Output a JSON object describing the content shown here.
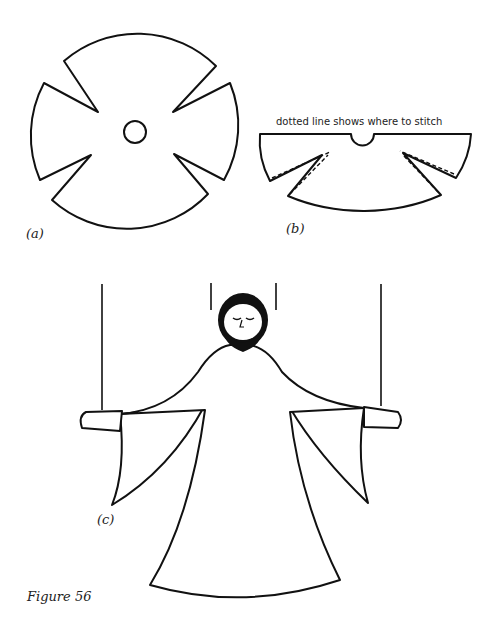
{
  "figure": {
    "caption": "Figure 56",
    "panels": [
      {
        "id": "a",
        "label": "(a)",
        "description": "circular pattern piece with four notches and central hole"
      },
      {
        "id": "b",
        "label": "(b)",
        "description": "half-circle pattern with darts",
        "annotation": "dotted line shows where to stitch"
      },
      {
        "id": "c",
        "label": "(c)",
        "description": "assembled puppet figure in robe with strings"
      }
    ]
  },
  "colors": {
    "ink": "#111111",
    "paper": "#ffffff"
  }
}
